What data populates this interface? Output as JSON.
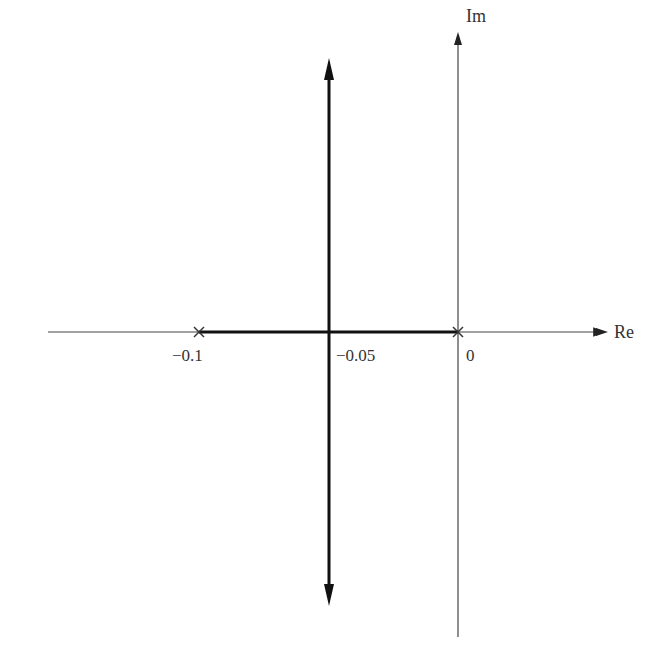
{
  "diagram": {
    "type": "root-locus",
    "axes": {
      "real_label": "Re",
      "imag_label": "Im"
    },
    "tick_labels": [
      "−0.1",
      "−0.05",
      "0"
    ],
    "poles": [
      {
        "re": -0.1,
        "im": 0,
        "marker": "x"
      },
      {
        "re": 0,
        "im": 0,
        "marker": "x"
      }
    ],
    "breakaway_point": {
      "re": -0.05,
      "im": 0
    },
    "branches": [
      {
        "from": -0.1,
        "to": -0.05,
        "direction": "along real axis"
      },
      {
        "from": 0,
        "to": -0.05,
        "direction": "along real axis"
      },
      {
        "vertical_line_at_re": -0.05,
        "arrows": [
          "up",
          "down"
        ]
      }
    ],
    "colors": {
      "axis": "#444444",
      "locus": "#111111"
    }
  }
}
